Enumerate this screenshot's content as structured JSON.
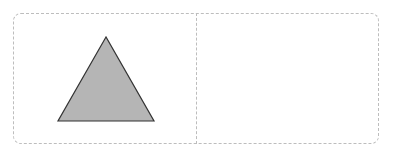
{
  "diagram": {
    "panels": [
      {
        "id": "left",
        "shape": {
          "type": "triangle",
          "points": "106,37 58,121 154,121",
          "fill": "#b5b5b5",
          "stroke": "#333333"
        }
      },
      {
        "id": "right",
        "shape": null
      }
    ],
    "frame_color": "#bdbdbd"
  }
}
